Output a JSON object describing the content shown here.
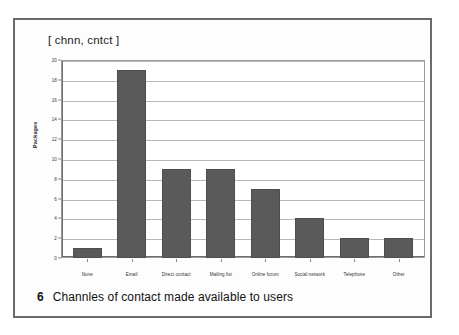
{
  "figure": {
    "caption_number": "6",
    "caption_text": "Channles of contact made available to users"
  },
  "chart_data": {
    "type": "bar",
    "title": "[ chnn, cntct ]",
    "xlabel": "",
    "ylabel": "Packages",
    "ylim": [
      0,
      20
    ],
    "yticks": [
      20,
      18,
      16,
      14,
      12,
      10,
      8,
      6,
      4,
      2,
      0
    ],
    "grid": true,
    "legend": null,
    "bar_color": "#5a5a5a",
    "categories": [
      "None",
      "Email",
      "Direct contact",
      "Mailing list",
      "Online forum",
      "Social network",
      "Telephone",
      "Other"
    ],
    "values": [
      1,
      19,
      9,
      9,
      7,
      4,
      2,
      2
    ]
  }
}
